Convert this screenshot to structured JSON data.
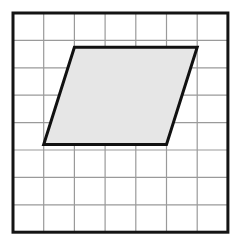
{
  "figure": {
    "name": "parallelogram-on-grid",
    "background_color": "#ffffff"
  },
  "grid": {
    "columns": 7,
    "rows": 8,
    "cell_width": 30.7,
    "cell_height": 27.4,
    "origin_x": 13,
    "origin_y": 13,
    "line_color": "#9a9a9a",
    "line_width": 1.2,
    "border_color": "#141414",
    "border_width": 3,
    "fill_color": "#ffffff"
  },
  "shape": {
    "type": "parallelogram",
    "fill_color": "#e6e6e6",
    "stroke_color": "#111111",
    "stroke_width": 3,
    "vertices": [
      {
        "label": "top-left",
        "col": 2,
        "row": 1.25,
        "x": 74.4,
        "y": 47.3
      },
      {
        "label": "top-right",
        "col": 6,
        "row": 1.25,
        "x": 197.2,
        "y": 47.3
      },
      {
        "label": "bottom-right",
        "col": 5,
        "row": 4.8,
        "x": 166.5,
        "y": 144.5
      },
      {
        "label": "bottom-left",
        "col": 1,
        "row": 4.8,
        "x": 43.7,
        "y": 144.5
      }
    ],
    "base_cells": 4,
    "height_cells": 3.55,
    "horizontal_offset_cells": 1
  }
}
